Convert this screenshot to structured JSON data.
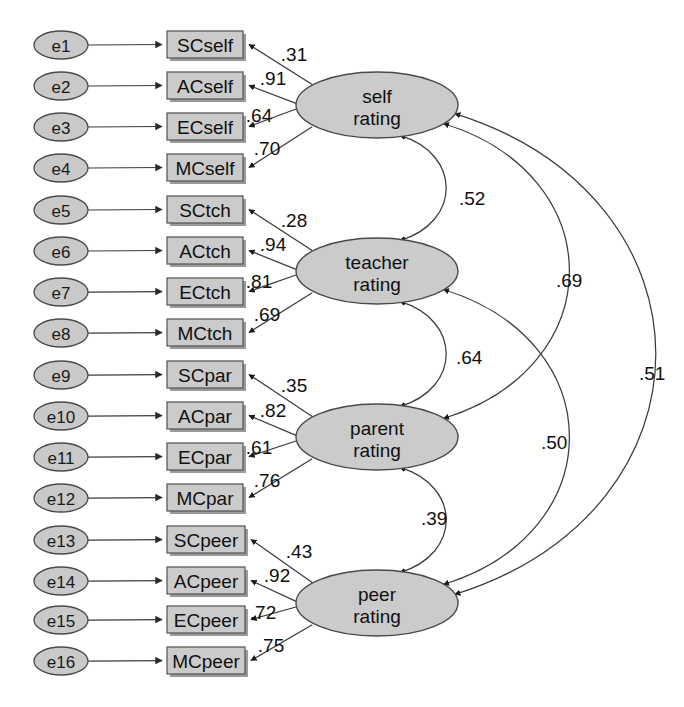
{
  "diagram": {
    "type": "structural-equation-model",
    "colors": {
      "node_fill": "#cbcbcb",
      "node_stroke": "#4a4a4a",
      "path_stroke": "#3c3c3c",
      "background": "#ffffff"
    },
    "errors": [
      {
        "id": "e1",
        "label": "e1",
        "cx": 61,
        "cy": 45,
        "rx": 27,
        "ry": 14
      },
      {
        "id": "e2",
        "label": "e2",
        "cx": 61,
        "cy": 86,
        "rx": 27,
        "ry": 14
      },
      {
        "id": "e3",
        "label": "e3",
        "cx": 61,
        "cy": 127,
        "rx": 27,
        "ry": 14
      },
      {
        "id": "e4",
        "label": "e4",
        "cx": 61,
        "cy": 168,
        "rx": 27,
        "ry": 14
      },
      {
        "id": "e5",
        "label": "e5",
        "cx": 61,
        "cy": 210,
        "rx": 27,
        "ry": 14
      },
      {
        "id": "e6",
        "label": "e6",
        "cx": 61,
        "cy": 251,
        "rx": 27,
        "ry": 14
      },
      {
        "id": "e7",
        "label": "e7",
        "cx": 61,
        "cy": 292,
        "rx": 27,
        "ry": 14
      },
      {
        "id": "e8",
        "label": "e8",
        "cx": 61,
        "cy": 333,
        "rx": 27,
        "ry": 14
      },
      {
        "id": "e9",
        "label": "e9",
        "cx": 61,
        "cy": 375,
        "rx": 27,
        "ry": 14
      },
      {
        "id": "e10",
        "label": "e10",
        "cx": 61,
        "cy": 416,
        "rx": 27,
        "ry": 14
      },
      {
        "id": "e11",
        "label": "e11",
        "cx": 61,
        "cy": 457,
        "rx": 27,
        "ry": 14
      },
      {
        "id": "e12",
        "label": "e12",
        "cx": 61,
        "cy": 498,
        "rx": 27,
        "ry": 14
      },
      {
        "id": "e13",
        "label": "e13",
        "cx": 61,
        "cy": 540,
        "rx": 27,
        "ry": 14
      },
      {
        "id": "e14",
        "label": "e14",
        "cx": 61,
        "cy": 581,
        "rx": 27,
        "ry": 14
      },
      {
        "id": "e15",
        "label": "e15",
        "cx": 61,
        "cy": 620,
        "rx": 27,
        "ry": 14
      },
      {
        "id": "e16",
        "label": "e16",
        "cx": 61,
        "cy": 661,
        "rx": 27,
        "ry": 14
      }
    ],
    "indicators": [
      {
        "id": "SCself",
        "label": "SCself",
        "x": 167,
        "y": 31,
        "w": 76,
        "h": 27
      },
      {
        "id": "ACself",
        "label": "ACself",
        "x": 167,
        "y": 72,
        "w": 76,
        "h": 27
      },
      {
        "id": "ECself",
        "label": "ECself",
        "x": 167,
        "y": 113,
        "w": 76,
        "h": 27
      },
      {
        "id": "MCself",
        "label": "MCself",
        "x": 167,
        "y": 154,
        "w": 76,
        "h": 27
      },
      {
        "id": "SCtch",
        "label": "SCtch",
        "x": 167,
        "y": 196,
        "w": 76,
        "h": 27
      },
      {
        "id": "ACtch",
        "label": "ACtch",
        "x": 167,
        "y": 237,
        "w": 76,
        "h": 27
      },
      {
        "id": "ECtch",
        "label": "ECtch",
        "x": 167,
        "y": 278,
        "w": 76,
        "h": 27
      },
      {
        "id": "MCtch",
        "label": "MCtch",
        "x": 167,
        "y": 319,
        "w": 76,
        "h": 27
      },
      {
        "id": "SCpar",
        "label": "SCpar",
        "x": 167,
        "y": 361,
        "w": 76,
        "h": 27
      },
      {
        "id": "ACpar",
        "label": "ACpar",
        "x": 167,
        "y": 402,
        "w": 76,
        "h": 27
      },
      {
        "id": "ECpar",
        "label": "ECpar",
        "x": 167,
        "y": 443,
        "w": 76,
        "h": 27
      },
      {
        "id": "MCpar",
        "label": "MCpar",
        "x": 167,
        "y": 484,
        "w": 76,
        "h": 27
      },
      {
        "id": "SCpeer",
        "label": "SCpeer",
        "x": 167,
        "y": 526,
        "w": 78,
        "h": 27
      },
      {
        "id": "ACpeer",
        "label": "ACpeer",
        "x": 167,
        "y": 567,
        "w": 78,
        "h": 27
      },
      {
        "id": "ECpeer",
        "label": "ECpeer",
        "x": 167,
        "y": 606,
        "w": 78,
        "h": 27
      },
      {
        "id": "MCpeer",
        "label": "MCpeer",
        "x": 167,
        "y": 647,
        "w": 78,
        "h": 27
      }
    ],
    "factors": [
      {
        "id": "self",
        "line1": "self",
        "line2": "rating",
        "cx": 377,
        "cy": 105,
        "rx": 81,
        "ry": 33
      },
      {
        "id": "teacher",
        "line1": "teacher",
        "line2": "rating",
        "cx": 377,
        "cy": 271,
        "rx": 81,
        "ry": 33
      },
      {
        "id": "parent",
        "line1": "parent",
        "line2": "rating",
        "cx": 377,
        "cy": 437,
        "rx": 81,
        "ry": 33
      },
      {
        "id": "peer",
        "line1": "peer",
        "line2": "rating",
        "cx": 377,
        "cy": 603,
        "rx": 81,
        "ry": 33
      }
    ],
    "loadings": [
      {
        "factor": "self",
        "indicator": "SCself",
        "value": ".31",
        "lx": 294,
        "ly": 54
      },
      {
        "factor": "self",
        "indicator": "ACself",
        "value": ".91",
        "lx": 273,
        "ly": 78
      },
      {
        "factor": "self",
        "indicator": "ECself",
        "value": ".64",
        "lx": 259,
        "ly": 115
      },
      {
        "factor": "self",
        "indicator": "MCself",
        "value": ".70",
        "lx": 267,
        "ly": 148
      },
      {
        "factor": "teacher",
        "indicator": "SCtch",
        "value": ".28",
        "lx": 294,
        "ly": 220
      },
      {
        "factor": "teacher",
        "indicator": "ACtch",
        "value": ".94",
        "lx": 273,
        "ly": 244
      },
      {
        "factor": "teacher",
        "indicator": "ECtch",
        "value": ".81",
        "lx": 259,
        "ly": 281
      },
      {
        "factor": "teacher",
        "indicator": "MCtch",
        "value": ".69",
        "lx": 267,
        "ly": 314
      },
      {
        "factor": "parent",
        "indicator": "SCpar",
        "value": ".35",
        "lx": 294,
        "ly": 385
      },
      {
        "factor": "parent",
        "indicator": "ACpar",
        "value": ".82",
        "lx": 273,
        "ly": 410
      },
      {
        "factor": "parent",
        "indicator": "ECpar",
        "value": ".61",
        "lx": 259,
        "ly": 447
      },
      {
        "factor": "parent",
        "indicator": "MCpar",
        "value": ".76",
        "lx": 267,
        "ly": 480
      },
      {
        "factor": "peer",
        "indicator": "SCpeer",
        "value": ".43",
        "lx": 299,
        "ly": 551
      },
      {
        "factor": "peer",
        "indicator": "ACpeer",
        "value": ".92",
        "lx": 277,
        "ly": 575
      },
      {
        "factor": "peer",
        "indicator": "ECpeer",
        "value": ".72",
        "lx": 263,
        "ly": 612
      },
      {
        "factor": "peer",
        "indicator": "MCpeer",
        "value": ".75",
        "lx": 271,
        "ly": 645
      }
    ],
    "correlations": [
      {
        "from": "self",
        "to": "teacher",
        "value": ".52",
        "lx": 459,
        "ly": 198
      },
      {
        "from": "teacher",
        "to": "parent",
        "value": ".64",
        "lx": 456,
        "ly": 357
      },
      {
        "from": "parent",
        "to": "peer",
        "value": ".39",
        "lx": 421,
        "ly": 518
      },
      {
        "from": "self",
        "to": "parent",
        "value": ".69",
        "lx": 556,
        "ly": 280
      },
      {
        "from": "teacher",
        "to": "peer",
        "value": ".50",
        "lx": 541,
        "ly": 442
      },
      {
        "from": "self",
        "to": "peer",
        "value": ".51",
        "lx": 639,
        "ly": 373
      }
    ]
  }
}
